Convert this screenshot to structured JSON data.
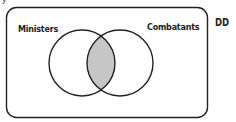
{
  "diagram": {
    "type": "venn",
    "universe_label": "DD",
    "sets": [
      {
        "name": "Ministers",
        "cx": 82,
        "cy": 63,
        "r": 33
      },
      {
        "name": "Combatants",
        "cx": 120,
        "cy": 63,
        "r": 33
      }
    ],
    "shaded_region": "intersection",
    "colors": {
      "stroke": "#222222",
      "shade": "#c6c6c6",
      "background": "#ffffff"
    }
  },
  "labels": {
    "left_set": "Ministers",
    "right_set": "Combatants",
    "universe": "DD",
    "top_fragment": "y"
  }
}
